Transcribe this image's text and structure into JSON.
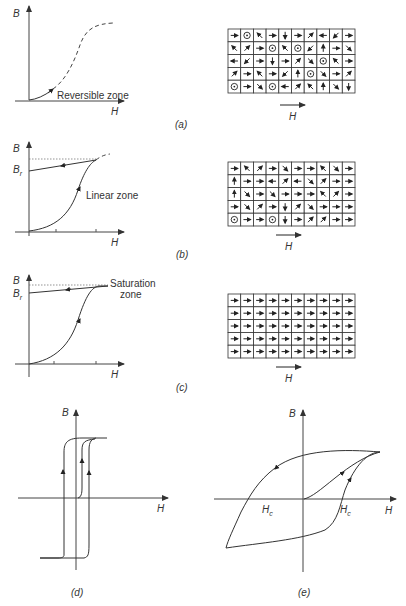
{
  "figure": {
    "panels": [
      {
        "id": "a",
        "caption": "(a)",
        "plot": {
          "y_axis_label": "B",
          "x_axis_label": "H",
          "annotation": "Reversible zone",
          "curve_style": "solid initial segment then dashed S-curve"
        },
        "domains": {
          "field_label": "H",
          "rows": 5,
          "cols": 10,
          "cells": [
            [
              "E",
              "O",
              "NW",
              "E",
              "S",
              "E",
              "NE",
              "W",
              "SW",
              "E"
            ],
            [
              "NW",
              "NE",
              "E",
              "O",
              "NW",
              "O",
              "SW",
              "N",
              "E",
              "SE"
            ],
            [
              "W",
              "SW",
              "E",
              "S",
              "E",
              "NE",
              "SE",
              "O",
              "NW",
              "E"
            ],
            [
              "NE",
              "E",
              "NW",
              "E",
              "SW",
              "N",
              "O",
              "SE",
              "E",
              "NE"
            ],
            [
              "O",
              "E",
              "SE",
              "O",
              "W",
              "NE",
              "NW",
              "N",
              "SE",
              "S"
            ]
          ]
        }
      },
      {
        "id": "b",
        "caption": "(b)",
        "plot": {
          "y_axis_label": "B",
          "x_axis_label": "H",
          "remanence_label": "Br",
          "annotation": "Linear zone"
        },
        "domains": {
          "field_label": "H",
          "rows": 5,
          "cols": 10,
          "cells": [
            [
              "E",
              "NW",
              "NE",
              "E",
              "SE",
              "E",
              "E",
              "NW",
              "SE",
              "E"
            ],
            [
              "N",
              "E",
              "E",
              "W",
              "NE",
              "W",
              "SE",
              "NE",
              "E",
              "E"
            ],
            [
              "N",
              "SE",
              "E",
              "SE",
              "E",
              "E",
              "E",
              "NW",
              "NE",
              "E"
            ],
            [
              "E",
              "SE",
              "NE",
              "E",
              "S",
              "NE",
              "SE",
              "E",
              "E",
              "E"
            ],
            [
              "O",
              "E",
              "E",
              "O",
              "S",
              "E",
              "NE",
              "NE",
              "E",
              "E"
            ]
          ]
        }
      },
      {
        "id": "c",
        "caption": "(c)",
        "plot": {
          "y_axis_label": "B",
          "x_axis_label": "H",
          "remanence_label": "Br",
          "annotation_line1": "Saturation",
          "annotation_line2": "zone"
        },
        "domains": {
          "field_label": "H",
          "rows": 5,
          "cols": 10,
          "cells": [
            [
              "E",
              "E",
              "E",
              "E",
              "E",
              "E",
              "E",
              "E",
              "E",
              "E"
            ],
            [
              "E",
              "E",
              "E",
              "E",
              "E",
              "E",
              "E",
              "E",
              "E",
              "E"
            ],
            [
              "E",
              "E",
              "E",
              "E",
              "E",
              "E",
              "E",
              "E",
              "E",
              "E"
            ],
            [
              "E",
              "E",
              "E",
              "E",
              "E",
              "E",
              "E",
              "E",
              "E",
              "E"
            ],
            [
              "E",
              "E",
              "E",
              "E",
              "E",
              "E",
              "E",
              "E",
              "E",
              "E"
            ]
          ]
        }
      },
      {
        "id": "d",
        "caption": "(d)",
        "plot": {
          "y_axis_label": "B",
          "x_axis_label": "H",
          "description": "square hysteresis loop"
        }
      },
      {
        "id": "e",
        "caption": "(e)",
        "plot": {
          "y_axis_label": "B",
          "x_axis_label": "H",
          "coercivity_left_label": "Hc",
          "coercivity_right_label": "Hc",
          "description": "rounded hysteresis loop with initial magnetization curve"
        }
      }
    ]
  },
  "legend": {
    "O": "dot-in-circle (out of page)",
    "E": "→",
    "W": "←",
    "N": "↑",
    "S": "↓",
    "NE": "↗",
    "NW": "↖",
    "SE": "↘",
    "SW": "↙"
  },
  "colors": {
    "ink": "#333333",
    "background": "#ffffff"
  }
}
